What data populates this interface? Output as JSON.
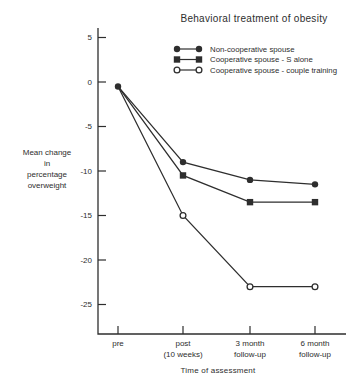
{
  "figure_title": "Behavioral treatment of obesity",
  "chart_data": {
    "type": "line",
    "title": "Behavioral treatment of obesity",
    "xlabel": "Time of assessment",
    "ylabel": "Mean change in percentage overweight",
    "ylabel_lines": [
      "Mean change",
      "in",
      "percentage",
      "overweight"
    ],
    "categories": [
      [
        "pre"
      ],
      [
        "post",
        "(10 weeks)"
      ],
      [
        "3 month",
        "follow-up"
      ],
      [
        "6 month",
        "follow-up"
      ]
    ],
    "yticks": [
      "5",
      "0",
      "-5",
      "-10",
      "-15",
      "-20",
      "-25"
    ],
    "ylim": [
      -28.3,
      6.1
    ],
    "grid": false,
    "legend_position": "upper-right",
    "series": [
      {
        "name": "Non-cooperative spouse",
        "marker": "filled-circle",
        "values": [
          -0.5,
          -9,
          -11,
          -11.5
        ]
      },
      {
        "name": "Cooperative spouse - S alone",
        "marker": "filled-square",
        "values": [
          -0.5,
          -10.5,
          -13.5,
          -13.5
        ]
      },
      {
        "name": "Cooperative spouse - couple training",
        "marker": "open-circle",
        "values": [
          -0.5,
          -15,
          -23,
          -23
        ]
      }
    ],
    "colors": {
      "ink": "#2e2e2e",
      "background": "#ffffff"
    }
  }
}
